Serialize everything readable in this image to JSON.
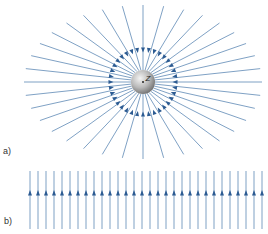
{
  "panels": {
    "a": {
      "label": "a)",
      "description": "Radial field lines converging onto a charged sphere",
      "charge_label": "Z",
      "center": [
        143,
        82
      ],
      "sphere_radius": 12,
      "line_count": 36,
      "outer_radius_x": 119,
      "outer_radius_y": 77,
      "arrow_radius": 32,
      "arrow_direction": "inward"
    },
    "b": {
      "label": "b)",
      "description": "Uniform parallel field lines",
      "line_count": 30,
      "x_start": 30,
      "spacing": 8,
      "y_top": 171,
      "y_bottom": 229,
      "arrow_y": 193,
      "arrow_direction": "up"
    }
  },
  "colors": {
    "line": "#7096bd",
    "arrow": "#2c5b92",
    "sphere_light": "#f2f2f2",
    "sphere_dark": "#7a7a7a",
    "label": "#333333"
  }
}
